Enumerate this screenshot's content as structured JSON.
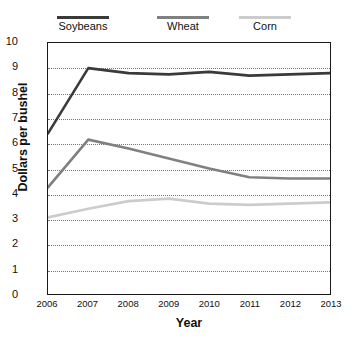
{
  "chart_data": {
    "type": "line",
    "title": "",
    "xlabel": "Year",
    "ylabel": "Dollars per bushel",
    "categories": [
      "2006",
      "2007",
      "2008",
      "2009",
      "2010",
      "2011",
      "2012",
      "2013"
    ],
    "x": [
      2006,
      2007,
      2008,
      2009,
      2010,
      2011,
      2012,
      2013
    ],
    "ylim": [
      0,
      10
    ],
    "yticks": [
      0,
      1,
      2,
      3,
      4,
      5,
      6,
      7,
      8,
      9,
      10
    ],
    "ytick_labels": [
      "0",
      "1",
      "2",
      "3",
      "4",
      "5",
      "6",
      "7",
      "8",
      "9",
      "10"
    ],
    "grid": "horizontal-dotted",
    "legend_position": "top",
    "series": [
      {
        "name": "Soybeans",
        "color": "#3a3a3a",
        "values": [
          6.4,
          9.0,
          8.8,
          8.75,
          8.85,
          8.7,
          8.75,
          8.8
        ]
      },
      {
        "name": "Wheat",
        "color": "#808080",
        "values": [
          4.25,
          6.15,
          5.8,
          5.4,
          5.0,
          4.65,
          4.6,
          4.6
        ]
      },
      {
        "name": "Corn",
        "color": "#cccccc",
        "values": [
          3.05,
          3.4,
          3.7,
          3.8,
          3.6,
          3.55,
          3.6,
          3.65
        ]
      }
    ]
  },
  "legend": {
    "items": [
      {
        "label": "Soybeans",
        "color": "#3a3a3a"
      },
      {
        "label": "Wheat",
        "color": "#808080"
      },
      {
        "label": "Corn",
        "color": "#cccccc"
      }
    ]
  },
  "axes": {
    "y_title": "Dollars per bushel",
    "x_title": "Year"
  }
}
